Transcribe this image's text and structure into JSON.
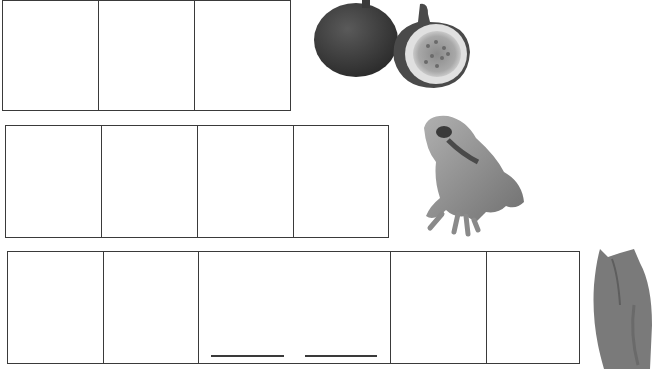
{
  "worksheet": {
    "rows": [
      {
        "word_picture": "fig",
        "letter_boxes": 3
      },
      {
        "word_picture": "frog",
        "letter_boxes": 4
      },
      {
        "word_picture": "jacket",
        "letter_boxes": 5,
        "middle_cell_blanks": 2
      }
    ]
  },
  "colors": {
    "line": "#3a3a3a",
    "background": "#ffffff",
    "fig_skin": "#3f3f3f",
    "fig_flesh": "#9a9a9a",
    "frog": "#8a8a8a",
    "jacket": "#7a7a7a"
  },
  "icons": {
    "fig": "fig-picture",
    "frog": "frog-picture",
    "jacket": "jacket-picture"
  }
}
